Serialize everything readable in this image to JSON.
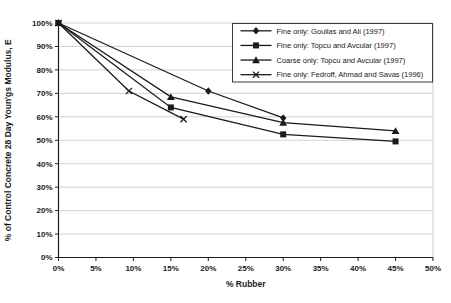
{
  "chart_data": {
    "type": "line",
    "title": "",
    "xlabel": "% Rubber",
    "ylabel": "% of Control Concrete 28 Day Youn'gs Modulus, E",
    "xlim": [
      0,
      50
    ],
    "ylim": [
      0,
      100
    ],
    "x_tick_step": 5,
    "y_tick_step": 10,
    "x_tick_labels": [
      "0%",
      "5%",
      "10%",
      "15%",
      "20%",
      "25%",
      "30%",
      "35%",
      "40%",
      "45%",
      "50%"
    ],
    "y_tick_labels": [
      "0%",
      "10%",
      "20%",
      "30%",
      "40%",
      "50%",
      "60%",
      "70%",
      "80%",
      "90%",
      "100%"
    ],
    "grid": "horizontal",
    "legend_position": "top-right",
    "series": [
      {
        "name": "Fine only: Goulias and Ali (1997)",
        "marker": "diamond",
        "x": [
          0,
          20,
          30
        ],
        "y": [
          100,
          71,
          59.5
        ]
      },
      {
        "name": "Fine only: Topcu and Avcular (1997)",
        "marker": "square",
        "x": [
          0,
          15,
          30,
          45
        ],
        "y": [
          100,
          64,
          52.5,
          49.5
        ]
      },
      {
        "name": "Coarse only: Topcu and Avcular (1997)",
        "marker": "triangle",
        "x": [
          0,
          15,
          30,
          45
        ],
        "y": [
          100,
          68.5,
          57.5,
          54
        ]
      },
      {
        "name": "Fine only: Fedroff, Ahmad and Savas (1996)",
        "marker": "x",
        "x": [
          0,
          9.4,
          16.7
        ],
        "y": [
          100,
          71,
          59
        ]
      }
    ],
    "colors": {
      "line": "#1a1a1a",
      "grid": "#c6c6c6",
      "text": "#1a1a1a",
      "background": "#ffffff",
      "legend_border": "#3a3a3a"
    }
  }
}
